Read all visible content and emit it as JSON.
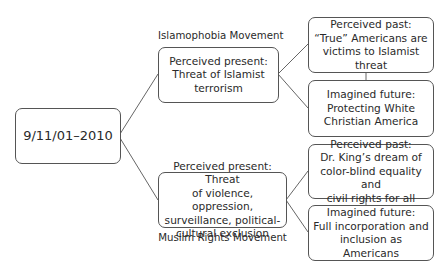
{
  "root": {
    "label": "9/11/01–2010"
  },
  "branches": [
    {
      "movement": "Islamophobia Movement",
      "present": "Perceived present:\nThreat of Islamist\nterrorism",
      "past": "Perceived past:\n“True” Americans are\nvictims to Islamist threat",
      "future": "Imagined future:\nProtecting White\nChristian America"
    },
    {
      "movement": "Muslim Rights Movement",
      "present": "Perceived present: Threat\nof violence, oppression,\nsurveillance, political-\ncultural exclusion",
      "past": "Perceived past:\nDr. King’s dream of\ncolor-blind equality and\ncivil rights for all",
      "future": "Imagined future:\nFull incorporation and\ninclusion as Americans"
    }
  ],
  "colors": {
    "line": "#555555",
    "text": "#2a2a2a",
    "background": "#ffffff"
  }
}
